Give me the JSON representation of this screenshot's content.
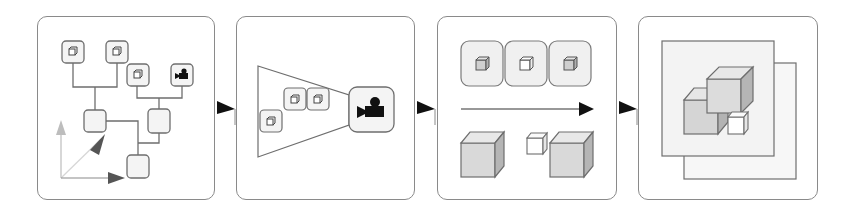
{
  "diagram": {
    "type": "pipeline",
    "stages": [
      {
        "id": "scene-graph",
        "label": "Scene graph",
        "nodes": [
          "cube-node-1",
          "cube-node-2",
          "cube-node-3",
          "camera-node",
          "group-node-a",
          "group-node-b",
          "root-node"
        ],
        "axes": [
          "y-axis",
          "z-axis",
          "x-axis"
        ]
      },
      {
        "id": "view-frustum",
        "label": "Camera frustum culling",
        "objects_in_frustum": 3,
        "camera": "camera-icon"
      },
      {
        "id": "level-of-detail",
        "label": "Object processing",
        "cube_tiles": 3
      },
      {
        "id": "rendered-layers",
        "label": "Composited output",
        "layers": 2,
        "cubes": 3
      }
    ],
    "connectors": 3
  },
  "colors": {
    "border": "#8a8a8a",
    "line": "#6e6e6e",
    "node_fill": "#f4f4f4",
    "cube_face": "#d9d9d9",
    "cube_side": "#b5b5b5",
    "cube_top": "#e8e8e8",
    "arrow": "#111111",
    "axis_light": "#bdbdbd",
    "axis_dark": "#555555",
    "layer_fill": "#f5f5f5"
  }
}
